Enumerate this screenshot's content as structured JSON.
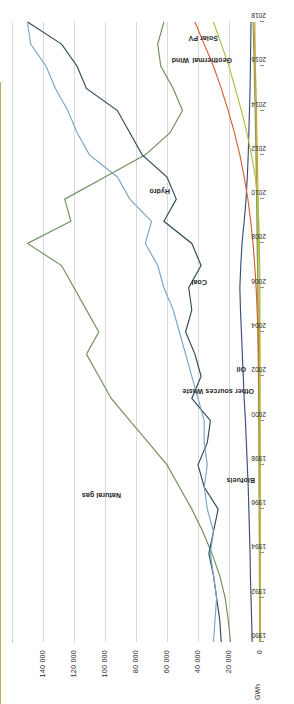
{
  "chart_data": {
    "type": "line",
    "title": "",
    "xlabel": "",
    "ylabel": "GWh",
    "ylim": [
      0,
      160000
    ],
    "yticks": [
      0,
      20000,
      40000,
      60000,
      80000,
      100000,
      120000,
      140000
    ],
    "ytick_labels": [
      "0",
      "20 000",
      "40 000",
      "60 000",
      "80 000",
      "100 000",
      "120 000",
      "140 000"
    ],
    "xlim": [
      1990,
      2018
    ],
    "x": [
      1990,
      1991,
      1992,
      1993,
      1994,
      1995,
      1996,
      1997,
      1998,
      1999,
      2000,
      2001,
      2002,
      2003,
      2004,
      2005,
      2006,
      2007,
      2008,
      2009,
      2010,
      2011,
      2012,
      2013,
      2014,
      2015,
      2016,
      2017,
      2018
    ],
    "xtick_labels": [
      "1990",
      "1992",
      "1994",
      "1996",
      "1998",
      "2000",
      "2002",
      "2004",
      "2006",
      "2008",
      "2010",
      "2012",
      "2014",
      "2016",
      "2018"
    ],
    "xticks": [
      1990,
      1992,
      1994,
      1996,
      1998,
      2000,
      2002,
      2004,
      2006,
      2008,
      2010,
      2012,
      2014,
      2016,
      2018
    ],
    "grid": true,
    "legend": "inline-labels",
    "series": [
      {
        "name": "Natural gas",
        "color": "#6f8f5e",
        "values": [
          19000,
          20500,
          22500,
          26000,
          31000,
          37000,
          44000,
          52000,
          60000,
          72000,
          84000,
          96000,
          104000,
          112000,
          104000,
          112000,
          120000,
          128000,
          150000,
          122000,
          126000,
          100000,
          74000,
          58000,
          50000,
          56000,
          64000,
          66000,
          62000
        ]
      },
      {
        "name": "Hydro",
        "color": "#2e4a5a",
        "values": [
          25000,
          26000,
          28000,
          30000,
          33000,
          30000,
          27000,
          36000,
          40000,
          34000,
          32000,
          44000,
          38000,
          42000,
          48000,
          44000,
          46000,
          38000,
          44000,
          62000,
          54000,
          60000,
          76000,
          84000,
          92000,
          112000,
          118000,
          128000,
          150000
        ]
      },
      {
        "name": "Coal",
        "color": "#79a6c4",
        "values": [
          30000,
          29000,
          28000,
          30000,
          32000,
          30000,
          34000,
          36000,
          34000,
          36000,
          36000,
          40000,
          44000,
          48000,
          52000,
          56000,
          62000,
          66000,
          74000,
          70000,
          84000,
          92000,
          110000,
          118000,
          124000,
          132000,
          138000,
          148000,
          150000
        ]
      },
      {
        "name": "Oil",
        "color": "#3a4f7a",
        "values": [
          5000,
          5400,
          5800,
          6200,
          6400,
          6800,
          7200,
          7600,
          8200,
          8800,
          9400,
          10200,
          10800,
          11400,
          12000,
          12600,
          13000,
          12400,
          11600,
          10200,
          9000,
          8200,
          7600,
          7200,
          6800,
          6400,
          6200,
          6000,
          5800
        ]
      },
      {
        "name": "Other sources Waste",
        "color": "#c9c07a",
        "values": [
          300,
          340,
          380,
          430,
          480,
          540,
          600,
          660,
          720,
          800,
          880,
          960,
          1060,
          1160,
          1260,
          1380,
          1500,
          1640,
          1780,
          1900,
          2050,
          2200,
          2350,
          2500,
          2650,
          2800,
          2950,
          3100,
          3250
        ]
      },
      {
        "name": "Biofuels",
        "color": "#8a9a58",
        "values": [
          200,
          230,
          260,
          300,
          340,
          390,
          440,
          500,
          560,
          640,
          720,
          810,
          910,
          1020,
          1140,
          1270,
          1420,
          1580,
          1760,
          1950,
          2150,
          2380,
          2620,
          2880,
          3160,
          3460,
          3780,
          4120,
          4480
        ]
      },
      {
        "name": "Wind",
        "color": "#d4603a",
        "values": [
          0,
          0,
          0,
          10,
          20,
          40,
          70,
          110,
          170,
          250,
          360,
          500,
          700,
          980,
          1350,
          1850,
          2500,
          3400,
          4500,
          6000,
          7800,
          10200,
          13000,
          16500,
          20500,
          25000,
          30000,
          36000,
          42000
        ]
      },
      {
        "name": "Geothermal",
        "color": "#c9a227",
        "values": [
          0,
          0,
          0,
          0,
          0,
          0,
          0,
          0,
          0,
          0,
          50,
          90,
          140,
          200,
          280,
          380,
          500,
          650,
          820,
          1000,
          1200,
          1450,
          1700,
          2000,
          2300,
          2650,
          3000,
          3400,
          3800
        ]
      },
      {
        "name": "Solar PV",
        "color": "#a8c23f",
        "values": [
          0,
          0,
          0,
          0,
          0,
          0,
          0,
          0,
          0,
          0,
          0,
          0,
          0,
          0,
          20,
          50,
          100,
          200,
          400,
          800,
          1500,
          3000,
          5500,
          8500,
          12000,
          16000,
          20000,
          25000,
          30000
        ]
      }
    ],
    "inline_labels": [
      {
        "text": "Natural gas",
        "series": "Natural gas"
      },
      {
        "text": "Hydro",
        "series": "Hydro"
      },
      {
        "text": "Coal",
        "series": "Coal"
      },
      {
        "text": "Oil",
        "series": "Oil"
      },
      {
        "text": "Other sources Waste",
        "series": "Other sources Waste"
      },
      {
        "text": "Biofuels",
        "series": "Biofuels"
      },
      {
        "text": "Wind",
        "series": "Wind"
      },
      {
        "text": "Geothermal",
        "series": "Geothermal"
      },
      {
        "text": "Solar PV",
        "series": "Solar PV"
      }
    ]
  }
}
